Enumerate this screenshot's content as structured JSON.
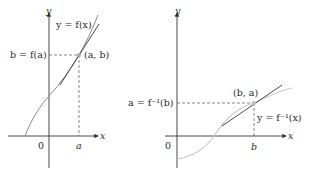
{
  "left_panel": {
    "y_axis_label": "y",
    "x_axis_label": "x",
    "origin_label": "0",
    "curve_label": "y = f(x)",
    "y_value_label": "b = f(a)",
    "point_label": "(a, b)",
    "x_value_label": "a"
  },
  "right_panel": {
    "y_axis_label": "y",
    "x_axis_label": "x",
    "origin_label": "0",
    "curve_label": "y = f⁻¹(x)",
    "y_value_label": "a = f⁻¹(b)",
    "point_label": "(b, a)",
    "x_value_label": "b"
  },
  "colors": {
    "axis": "#333333",
    "curve_left": "#8a8a8a",
    "curve_right": "#c8c8c8",
    "tangent": "#333333",
    "dashed": "#555555",
    "point": "#a8a8a8"
  }
}
